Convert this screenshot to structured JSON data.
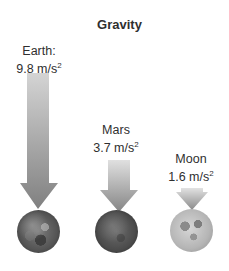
{
  "title": "Gravity",
  "bodies": [
    {
      "name": "Earth:",
      "value": "9.8 m/s",
      "exp": "2",
      "gravity": 9.8,
      "unit": "m/s²"
    },
    {
      "name": "Mars",
      "value": "3.7 m/s",
      "exp": "2",
      "gravity": 3.7,
      "unit": "m/s²"
    },
    {
      "name": "Moon",
      "value": "1.6 m/s",
      "exp": "2",
      "gravity": 1.6,
      "unit": "m/s²"
    }
  ],
  "colors": {
    "arrow_top": "#d9d9d9",
    "arrow_bottom": "#7a7a7a",
    "text": "#2f2f2f"
  }
}
